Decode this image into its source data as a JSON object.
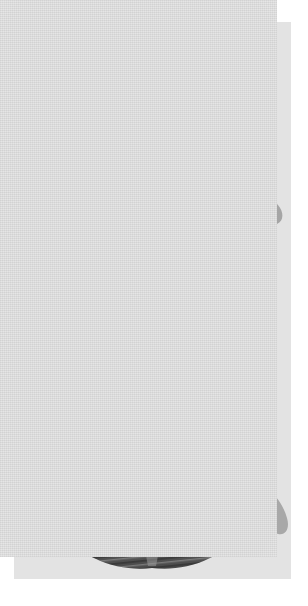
{
  "plate": {
    "medium": "halftone print",
    "page_background": "#ffffff",
    "paper_tone": "#e3e3e3",
    "orientation": "portrait",
    "figure_count": 2,
    "subject": "larynx superior laryngoscopic view",
    "labels_present": "none",
    "text_present": "none"
  },
  "palette": {
    "paper": "#e3e3e3",
    "paper_light": "#ececec",
    "rim_light": "#b9b9b9",
    "rim_mid": "#9a9a9a",
    "rim_shadow": "#7d7d7d",
    "tissue_dark": "#4a4a4a",
    "tissue_darkest": "#343434",
    "tissue_mid": "#6a6a6a",
    "highlight": "#d8d8d8",
    "glottis_white": "#efefef",
    "outline": "#5a5a5a"
  },
  "figures": [
    {
      "id": "figure-upper",
      "name": "larynx-superior-view-mucosa",
      "description": "Superior laryngoscopic view with intact mucosa: epiglottis, aryepiglottic folds, vestibular and vocal folds, arytenoid region",
      "parts": [
        {
          "name": "epiglottis-rim",
          "tone": "#a2a2a2"
        },
        {
          "name": "aryepiglottic-fold-left",
          "tone": "#9a9a9a"
        },
        {
          "name": "aryepiglottic-fold-right",
          "tone": "#9a9a9a"
        },
        {
          "name": "vestibular-fold-left",
          "tone": "#444444"
        },
        {
          "name": "vestibular-fold-right",
          "tone": "#444444"
        },
        {
          "name": "rima-glottidis",
          "tone": "#eeeeee"
        },
        {
          "name": "arytenoid-cartilage-left",
          "tone": "#cfcfcf"
        },
        {
          "name": "arytenoid-cartilage-right",
          "tone": "#cfcfcf"
        },
        {
          "name": "cuneiform-tubercle-left",
          "tone": "#b4b4b4"
        },
        {
          "name": "cuneiform-tubercle-right",
          "tone": "#b4b4b4"
        },
        {
          "name": "posterior-wall",
          "tone": "#6f6f6f"
        },
        {
          "name": "superior-horn-left",
          "tone": "#a8a8a8"
        },
        {
          "name": "superior-horn-right",
          "tone": "#a8a8a8"
        }
      ]
    },
    {
      "id": "figure-lower",
      "name": "larynx-superior-view-muscles",
      "description": "Superior view with mucosa removed showing striated intrinsic laryngeal muscles, thyroarytenoid fibres and posterior cricoarytenoid region",
      "parts": [
        {
          "name": "epiglottis-rim",
          "tone": "#a2a2a2"
        },
        {
          "name": "thyroarytenoid-muscle-left",
          "tone": "#636363"
        },
        {
          "name": "thyroarytenoid-muscle-right",
          "tone": "#636363"
        },
        {
          "name": "vocal-ligament-left",
          "tone": "#ededed"
        },
        {
          "name": "vocal-ligament-right",
          "tone": "#ededed"
        },
        {
          "name": "rima-glottidis",
          "tone": "#efefef"
        },
        {
          "name": "arytenoid-muscle-block",
          "tone": "#3a3a3a"
        },
        {
          "name": "posterior-cricoarytenoid-left",
          "tone": "#4e4e4e"
        },
        {
          "name": "posterior-cricoarytenoid-right",
          "tone": "#4e4e4e"
        },
        {
          "name": "cricoid-lamina",
          "tone": "#585858"
        },
        {
          "name": "superior-horn-left",
          "tone": "#a8a8a8"
        },
        {
          "name": "superior-horn-right",
          "tone": "#a8a8a8"
        },
        {
          "name": "muscle-striation-count",
          "tone": "18"
        }
      ]
    }
  ]
}
